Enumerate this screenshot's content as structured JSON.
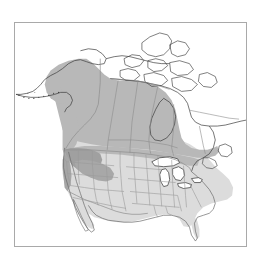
{
  "figure": {
    "kind": "distribution-range-map",
    "region": "North America",
    "background_color": "#ffffff",
    "frame": {
      "border_color": "#a9a9a9",
      "border_width_px": 1,
      "x": 14,
      "y": 22,
      "width": 233,
      "height": 225
    }
  },
  "map": {
    "projection_hint": "conic",
    "landmass_label": "North America",
    "coast_line_color": "#3a3a3a",
    "border_line_color": "#8d8d8d",
    "state_line_color": "#9a9a9a",
    "lake_fill": "#ffffff",
    "ocean_fill": "#ffffff",
    "land_unshaded_fill": "#ffffff"
  },
  "shading": {
    "levels": [
      {
        "name": "light-range",
        "fill": "#dcdcdc",
        "description": "contiguous United States and southern range extent"
      },
      {
        "name": "medium-range",
        "fill": "#b8b8b8",
        "description": "interior Alaska, western and central Canada core range"
      },
      {
        "name": "dark-range",
        "fill": "#a0a0a0",
        "description": "Pacific Northwest / northern Rockies concentration"
      }
    ]
  },
  "features": {
    "areas": [
      "Alaska",
      "Aleutian Islands",
      "Yukon",
      "Northwest Territories",
      "Nunavut",
      "Canadian Arctic Archipelago",
      "Hudson Bay",
      "Quebec",
      "Newfoundland",
      "Great Lakes",
      "Contiguous United States",
      "Baja California",
      "Gulf of Mexico",
      "Florida"
    ]
  },
  "chart_data": {
    "type": "map",
    "title": "",
    "xlabel": "",
    "ylabel": "",
    "categories": [
      "light-range",
      "medium-range",
      "dark-range",
      "no-range"
    ],
    "values": [
      3,
      2,
      1,
      0
    ],
    "legend_position": "none",
    "grid": false
  }
}
